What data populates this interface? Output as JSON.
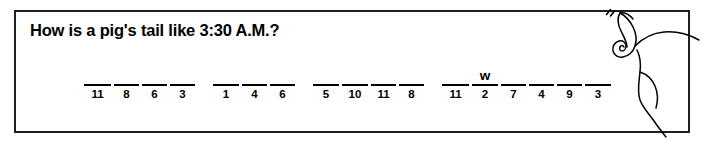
{
  "worksheet": {
    "riddle_question": "How is a pig's tail like 3:30 A.M.?",
    "answer_blanks": {
      "word_groups": [
        {
          "cells": [
            {
              "number": "11",
              "letter": "",
              "width": 27
            },
            {
              "number": "8",
              "letter": "",
              "width": 25
            },
            {
              "number": "6",
              "letter": "",
              "width": 25
            },
            {
              "number": "3",
              "letter": "",
              "width": 25
            }
          ]
        },
        {
          "cells": [
            {
              "number": "1",
              "letter": "",
              "width": 26
            },
            {
              "number": "4",
              "letter": "",
              "width": 25
            },
            {
              "number": "6",
              "letter": "",
              "width": 25
            }
          ]
        },
        {
          "cells": [
            {
              "number": "5",
              "letter": "",
              "width": 26
            },
            {
              "number": "10",
              "letter": "",
              "width": 26
            },
            {
              "number": "11",
              "letter": "",
              "width": 25
            },
            {
              "number": "8",
              "letter": "",
              "width": 25
            }
          ]
        },
        {
          "cells": [
            {
              "number": "11",
              "letter": "",
              "width": 27
            },
            {
              "number": "2",
              "letter": "w",
              "width": 26
            },
            {
              "number": "7",
              "letter": "",
              "width": 25
            },
            {
              "number": "4",
              "letter": "",
              "width": 25
            },
            {
              "number": "9",
              "letter": "",
              "width": 25
            },
            {
              "number": "3",
              "letter": "",
              "width": 26
            }
          ]
        }
      ]
    },
    "illustration": {
      "name": "pig-tail-drawing",
      "description": "pig rear with curly spiral tail and motion marks"
    },
    "colors": {
      "ink": "#000000",
      "border": "#231f20",
      "paper": "#ffffff"
    }
  }
}
